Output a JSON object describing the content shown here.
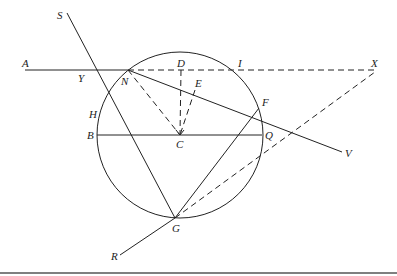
{
  "diagram": {
    "type": "geometry-construction",
    "circle": {
      "center": "C",
      "cx": 180,
      "cy": 135,
      "r": 83
    },
    "points": {
      "A": {
        "x": 25,
        "y": 70,
        "label": "A"
      },
      "Y": {
        "x": 86,
        "y": 70,
        "label": "Y"
      },
      "N": {
        "x": 128,
        "y": 70,
        "label": "N"
      },
      "D": {
        "x": 181,
        "y": 70,
        "label": "D"
      },
      "I": {
        "x": 236,
        "y": 70,
        "label": "I"
      },
      "X": {
        "x": 375,
        "y": 70,
        "label": "X"
      },
      "S": {
        "x": 67,
        "y": 13,
        "label": "S"
      },
      "H": {
        "x": 101,
        "y": 113,
        "label": "H"
      },
      "E": {
        "x": 195,
        "y": 90,
        "label": "E"
      },
      "F": {
        "x": 259,
        "y": 108,
        "label": "F"
      },
      "V": {
        "x": 342,
        "y": 152,
        "label": "V"
      },
      "B": {
        "x": 97,
        "y": 135,
        "label": "B"
      },
      "C": {
        "x": 180,
        "y": 135,
        "label": "C"
      },
      "Q": {
        "x": 262,
        "y": 135,
        "label": "Q"
      },
      "G": {
        "x": 175,
        "y": 218,
        "label": "G"
      },
      "R": {
        "x": 120,
        "y": 255,
        "label": "R"
      }
    },
    "solid_lines": [
      [
        "A",
        "N"
      ],
      [
        "S",
        "G"
      ],
      [
        "N",
        "V"
      ],
      [
        "B",
        "Q"
      ],
      [
        "G",
        "F"
      ],
      [
        "G",
        "R"
      ]
    ],
    "dashed_lines": [
      [
        "N",
        "X"
      ],
      [
        "N",
        "C"
      ],
      [
        "D",
        "C"
      ],
      [
        "E",
        "C"
      ],
      [
        "G",
        "X"
      ]
    ]
  }
}
